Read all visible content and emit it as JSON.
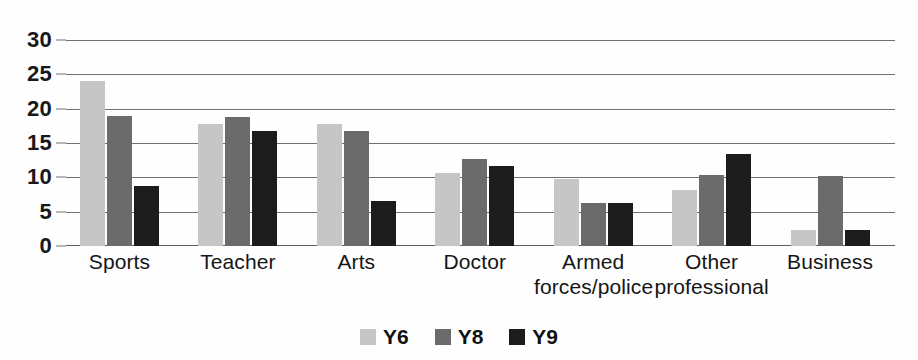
{
  "chart_data": {
    "type": "bar",
    "title": "",
    "subtitle": "",
    "xlabel": "",
    "ylabel": "",
    "ylim": [
      0,
      30
    ],
    "yticks": [
      0,
      5,
      10,
      15,
      20,
      25,
      30
    ],
    "ytick_labels": [
      "0",
      "5",
      "10",
      "15",
      "20",
      "25",
      "30"
    ],
    "grid": true,
    "grid_axis": "y",
    "legend_position": "bottom-center",
    "categories": [
      "Sports",
      "Teacher",
      "Arts",
      "Doctor",
      "Armed forces/police",
      "Other professional",
      "Business"
    ],
    "category_lines": [
      [
        "Sports"
      ],
      [
        "Teacher"
      ],
      [
        "Arts"
      ],
      [
        "Doctor"
      ],
      [
        "Armed",
        "forces/police"
      ],
      [
        "Other",
        "professional"
      ],
      [
        "Business"
      ]
    ],
    "series": [
      {
        "name": "Y6",
        "color": "#c6c6c6",
        "values": [
          24.0,
          17.8,
          17.8,
          10.6,
          9.7,
          8.2,
          2.4
        ]
      },
      {
        "name": "Y8",
        "color": "#6b6b6b",
        "values": [
          18.9,
          18.8,
          16.7,
          12.7,
          6.3,
          10.4,
          10.2
        ]
      },
      {
        "name": "Y9",
        "color": "#1c1c1c",
        "values": [
          8.8,
          16.8,
          6.5,
          11.6,
          6.3,
          13.4,
          2.3
        ]
      }
    ]
  },
  "legend": {
    "entries": [
      {
        "label": "Y6",
        "color": "#c6c6c6",
        "swatch_name": "legend-swatch-y6"
      },
      {
        "label": "Y8",
        "color": "#6b6b6b",
        "swatch_name": "legend-swatch-y8"
      },
      {
        "label": "Y9",
        "color": "#1c1c1c",
        "swatch_name": "legend-swatch-y9"
      }
    ]
  },
  "colors": {
    "y6": "#c6c6c6",
    "y8": "#6b6b6b",
    "y9": "#1c1c1c",
    "gridline": "#6f6f6f",
    "text": "#151515",
    "background": "#fefefe"
  }
}
